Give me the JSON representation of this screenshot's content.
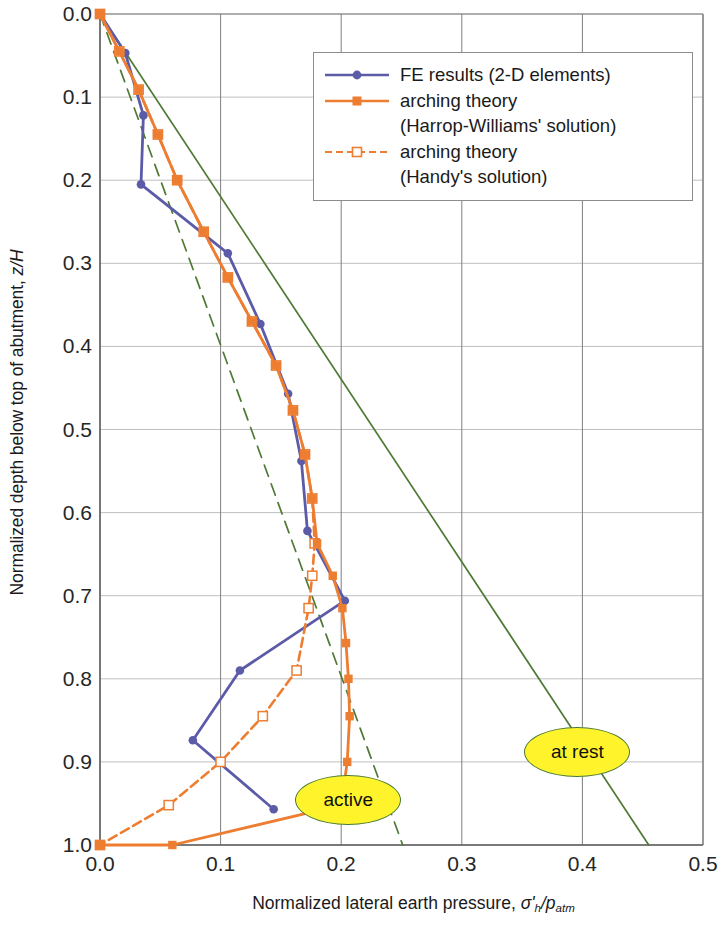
{
  "chart_data": {
    "type": "line",
    "title": "",
    "xlabel": "Normalized lateral earth pressure, σ'h/patm",
    "ylabel": "Normalized depth below top of abutment, z/H",
    "xlim": [
      0.0,
      0.5
    ],
    "ylim": [
      0.0,
      1.0
    ],
    "y_axis_inverted": true,
    "grid": true,
    "legend_position": "top-right inside plot",
    "xticks": [
      "0.0",
      "0.1",
      "0.2",
      "0.3",
      "0.4",
      "0.5"
    ],
    "yticks": [
      "0.0",
      "0.1",
      "0.2",
      "0.3",
      "0.4",
      "0.5",
      "0.6",
      "0.7",
      "0.8",
      "0.9",
      "1.0"
    ],
    "series": [
      {
        "name": "FE results (2-D elements)",
        "color": "#5B5BA8",
        "style": "solid",
        "marker": "circle",
        "points": [
          {
            "x": 0.0,
            "y": 0.0
          },
          {
            "x": 0.021,
            "y": 0.047
          },
          {
            "x": 0.036,
            "y": 0.122
          },
          {
            "x": 0.034,
            "y": 0.205
          },
          {
            "x": 0.106,
            "y": 0.288
          },
          {
            "x": 0.133,
            "y": 0.373
          },
          {
            "x": 0.156,
            "y": 0.457
          },
          {
            "x": 0.167,
            "y": 0.538
          },
          {
            "x": 0.172,
            "y": 0.622
          },
          {
            "x": 0.203,
            "y": 0.706
          },
          {
            "x": 0.116,
            "y": 0.79
          },
          {
            "x": 0.077,
            "y": 0.874
          },
          {
            "x": 0.144,
            "y": 0.957
          }
        ]
      },
      {
        "name": "arching theory\n(Harrop-Williams' solution)",
        "color": "#ED7D31",
        "style": "solid",
        "marker": "square-filled",
        "points": [
          {
            "x": 0.0,
            "y": 0.0
          },
          {
            "x": 0.016,
            "y": 0.045
          },
          {
            "x": 0.032,
            "y": 0.091
          },
          {
            "x": 0.048,
            "y": 0.145
          },
          {
            "x": 0.064,
            "y": 0.2
          },
          {
            "x": 0.086,
            "y": 0.262
          },
          {
            "x": 0.106,
            "y": 0.317
          },
          {
            "x": 0.126,
            "y": 0.37
          },
          {
            "x": 0.146,
            "y": 0.423
          },
          {
            "x": 0.16,
            "y": 0.477
          },
          {
            "x": 0.17,
            "y": 0.53
          },
          {
            "x": 0.176,
            "y": 0.583
          },
          {
            "x": 0.18,
            "y": 0.637
          },
          {
            "x": 0.193,
            "y": 0.676
          },
          {
            "x": 0.201,
            "y": 0.715
          },
          {
            "x": 0.204,
            "y": 0.757
          },
          {
            "x": 0.206,
            "y": 0.8
          },
          {
            "x": 0.207,
            "y": 0.845
          },
          {
            "x": 0.205,
            "y": 0.9
          },
          {
            "x": 0.2,
            "y": 0.952
          },
          {
            "x": 0.06,
            "y": 1.0
          },
          {
            "x": 0.0,
            "y": 1.0
          }
        ]
      },
      {
        "name": "arching theory\n(Handy's solution)",
        "color": "#ED7D31",
        "style": "dashed",
        "marker": "square-open",
        "points": [
          {
            "x": 0.0,
            "y": 0.0
          },
          {
            "x": 0.016,
            "y": 0.045
          },
          {
            "x": 0.032,
            "y": 0.091
          },
          {
            "x": 0.048,
            "y": 0.145
          },
          {
            "x": 0.064,
            "y": 0.2
          },
          {
            "x": 0.086,
            "y": 0.262
          },
          {
            "x": 0.106,
            "y": 0.317
          },
          {
            "x": 0.126,
            "y": 0.37
          },
          {
            "x": 0.146,
            "y": 0.423
          },
          {
            "x": 0.16,
            "y": 0.477
          },
          {
            "x": 0.17,
            "y": 0.53
          },
          {
            "x": 0.176,
            "y": 0.583
          },
          {
            "x": 0.178,
            "y": 0.637
          },
          {
            "x": 0.176,
            "y": 0.676
          },
          {
            "x": 0.173,
            "y": 0.715
          },
          {
            "x": 0.163,
            "y": 0.79
          },
          {
            "x": 0.135,
            "y": 0.845
          },
          {
            "x": 0.1,
            "y": 0.9
          },
          {
            "x": 0.057,
            "y": 0.952
          },
          {
            "x": 0.0,
            "y": 1.0
          }
        ]
      },
      {
        "name": "at rest",
        "color": "#4F7A36",
        "style": "solid",
        "marker": "none",
        "points": [
          {
            "x": 0.0,
            "y": 0.0
          },
          {
            "x": 0.455,
            "y": 1.0
          }
        ]
      },
      {
        "name": "active",
        "color": "#4F7A36",
        "style": "dashed",
        "marker": "none",
        "points": [
          {
            "x": 0.0,
            "y": 0.0
          },
          {
            "x": 0.251,
            "y": 1.0
          }
        ]
      }
    ],
    "annotations": [
      {
        "text": "active",
        "x": 0.205,
        "y": 0.945,
        "shape": "ellipse",
        "fill": "#FFF32B"
      },
      {
        "text": "at rest",
        "x": 0.395,
        "y": 0.887,
        "shape": "ellipse",
        "fill": "#FFF32B"
      }
    ]
  },
  "axes": {
    "x_title_prefix": "Normalized lateral earth pressure, ",
    "x_title_sigma": "σ'",
    "x_title_sub_h": "h",
    "x_title_slash_p": "/p",
    "x_title_sub_atm": "atm",
    "y_title_prefix": "Normalized depth below top of abutment, ",
    "y_title_zh": "z/H"
  },
  "legend": {
    "entries": [
      {
        "label": "FE results (2-D elements)",
        "color": "#5B5BA8",
        "style": "solid",
        "marker": "circle"
      },
      {
        "label": "arching theory\n(Harrop-Williams' solution)",
        "color": "#ED7D31",
        "style": "solid",
        "marker": "square-filled"
      },
      {
        "label": "arching theory\n(Handy's solution)",
        "color": "#ED7D31",
        "style": "dashed",
        "marker": "square-open"
      }
    ]
  }
}
